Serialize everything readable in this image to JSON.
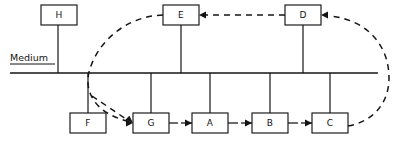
{
  "diagram": {
    "type": "process-flow-with-feedback-loop",
    "canvas": {
      "width": 407,
      "height": 144
    },
    "axis": {
      "label": "Medium",
      "label_x": 10,
      "label_y": 61,
      "underline_from_x": 10,
      "underline_to_x": 55,
      "underline_y": 64,
      "spine_from_x": 10,
      "spine_to_x": 378,
      "spine_y": 73
    },
    "nodes": [
      {
        "id": "H",
        "label": "H",
        "x": 41,
        "y": 5,
        "w": 36,
        "h": 20,
        "side": "above",
        "stem_x": 58,
        "stem_from_y": 25,
        "stem_to_y": 73
      },
      {
        "id": "E",
        "label": "E",
        "x": 163,
        "y": 5,
        "w": 36,
        "h": 20,
        "side": "above",
        "stem_x": 181,
        "stem_from_y": 25,
        "stem_to_y": 73
      },
      {
        "id": "D",
        "label": "D",
        "x": 285,
        "y": 5,
        "w": 36,
        "h": 20,
        "side": "above",
        "stem_x": 303,
        "stem_from_y": 25,
        "stem_to_y": 73
      },
      {
        "id": "F",
        "label": "F",
        "x": 70,
        "y": 113,
        "w": 36,
        "h": 20,
        "side": "below",
        "stem_x": 88,
        "stem_from_y": 73,
        "stem_to_y": 113
      },
      {
        "id": "G",
        "label": "G",
        "x": 133,
        "y": 113,
        "w": 36,
        "h": 20,
        "side": "below",
        "stem_x": 151,
        "stem_from_y": 73,
        "stem_to_y": 113
      },
      {
        "id": "A",
        "label": "A",
        "x": 192,
        "y": 113,
        "w": 36,
        "h": 20,
        "side": "below",
        "stem_x": 210,
        "stem_from_y": 73,
        "stem_to_y": 113
      },
      {
        "id": "B",
        "label": "B",
        "x": 252,
        "y": 113,
        "w": 36,
        "h": 20,
        "side": "below",
        "stem_x": 270,
        "stem_from_y": 73,
        "stem_to_y": 113
      },
      {
        "id": "C",
        "label": "C",
        "x": 312,
        "y": 113,
        "w": 36,
        "h": 20,
        "side": "below",
        "stem_x": 330,
        "stem_from_y": 73,
        "stem_to_y": 113
      }
    ],
    "solid_arrows": [
      {
        "from": "G",
        "to": "A",
        "stub_from_x": 169,
        "stub_to_x": 178,
        "arrow_from_x": 181,
        "arrow_tip_x": 192,
        "y": 123
      },
      {
        "from": "A",
        "to": "B",
        "stub_from_x": 228,
        "stub_to_x": 238,
        "arrow_from_x": 241,
        "arrow_tip_x": 252,
        "y": 123
      },
      {
        "from": "B",
        "to": "C",
        "stub_from_x": 288,
        "stub_to_x": 298,
        "arrow_from_x": 301,
        "arrow_tip_x": 312,
        "y": 123
      }
    ],
    "dashed_edges": [
      {
        "id": "d-to-e",
        "from": "D",
        "to": "E",
        "style": "straight",
        "x1": 285,
        "y1": 15,
        "x2": 203,
        "y2": 15,
        "arrow_tip_x": 199,
        "arrow_tip_y": 15,
        "arrow_dir": "left"
      },
      {
        "id": "c-to-d",
        "from": "C",
        "to": "D",
        "style": "curve-right",
        "path": "M 348 126 C 372 122 389 104 389 78 C 389 46 368 20 330 16",
        "arrow_tip_x": 321,
        "arrow_tip_y": 15,
        "arrow_dir": "left"
      },
      {
        "id": "e-to-g",
        "from": "E",
        "to": "G",
        "style": "curve-left",
        "path": "M 163 15 C 126 16 97 42 89 72 C 84 93 96 113 127 121",
        "arrow_tip_x": 133,
        "arrow_tip_y": 123,
        "arrow_dir": "right"
      },
      {
        "id": "f-to-g",
        "from": "F-stem",
        "to": "G",
        "style": "short-diagonal",
        "x1": 92,
        "y1": 96,
        "x2": 126,
        "y2": 119,
        "arrow_tip_x": 133,
        "arrow_tip_y": 123,
        "arrow_dir": "down-right"
      }
    ]
  }
}
